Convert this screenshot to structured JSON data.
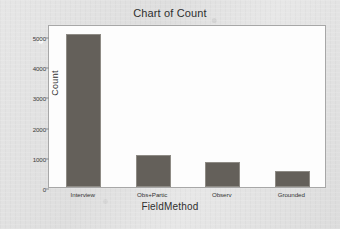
{
  "chart_data": {
    "type": "bar",
    "title": "Chart of Count",
    "xlabel": "FieldMethod",
    "ylabel": "Count",
    "categories": [
      "Interview",
      "Obs+Partic",
      "Observ",
      "Grounded"
    ],
    "values": [
      5080,
      1050,
      830,
      520
    ],
    "ylim": [
      0,
      5400
    ],
    "yticks": [
      0,
      1000,
      2000,
      3000,
      4000,
      5000
    ],
    "ytick_labels": [
      "0",
      "1000",
      "2000",
      "3000",
      "4000",
      "5000"
    ],
    "grid": false,
    "legend": "none",
    "bar_color": "#64605a",
    "plot_background": "#fdfdfd",
    "page_background": "#e4e4e4",
    "frame_color": "#a7a7a7"
  }
}
